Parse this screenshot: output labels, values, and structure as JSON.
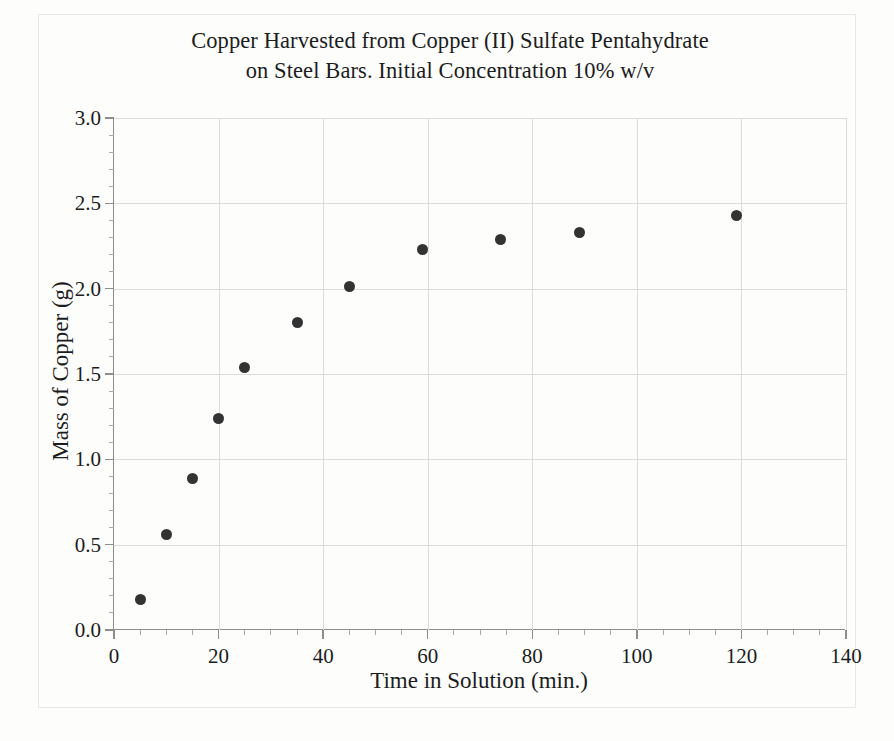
{
  "chart_data": {
    "type": "scatter",
    "title": "Copper Harvested from Copper (II) Sulfate Pentahydrate\non Steel Bars. Initial Concentration 10% w/v",
    "title_line1": "Copper Harvested from Copper (II) Sulfate Pentahydrate",
    "title_line2": "on Steel Bars. Initial Concentration 10% w/v",
    "xlabel": "Time in Solution (min.)",
    "ylabel": "Mass of Copper (g)",
    "xlim": [
      0,
      140
    ],
    "ylim": [
      0.0,
      3.0
    ],
    "x_major_step": 20,
    "x_minor_step": 5,
    "y_major_step": 0.5,
    "y_minor_step": 0.1,
    "grid": true,
    "legend": "none",
    "marker_color": "#333333",
    "grid_color": "#dcdcdc",
    "axis_color": "#8d8d8d",
    "x_tick_labels": [
      "0",
      "20",
      "40",
      "60",
      "80",
      "100",
      "120",
      "140"
    ],
    "x_tick_values": [
      0,
      20,
      40,
      60,
      80,
      100,
      120,
      140
    ],
    "y_tick_labels": [
      "0.0",
      "0.5",
      "1.0",
      "1.5",
      "2.0",
      "2.5",
      "3.0"
    ],
    "y_tick_values": [
      0.0,
      0.5,
      1.0,
      1.5,
      2.0,
      2.5,
      3.0
    ],
    "x": [
      5,
      10,
      15,
      20,
      25,
      35,
      45,
      59,
      74,
      89,
      119
    ],
    "y": [
      0.18,
      0.56,
      0.89,
      1.24,
      1.54,
      1.8,
      2.01,
      2.23,
      2.29,
      2.33,
      2.43
    ],
    "points": [
      {
        "x": 5,
        "y": 0.18
      },
      {
        "x": 10,
        "y": 0.56
      },
      {
        "x": 15,
        "y": 0.89
      },
      {
        "x": 20,
        "y": 1.24
      },
      {
        "x": 25,
        "y": 1.54
      },
      {
        "x": 35,
        "y": 1.8
      },
      {
        "x": 45,
        "y": 2.01
      },
      {
        "x": 59,
        "y": 2.23
      },
      {
        "x": 74,
        "y": 2.29
      },
      {
        "x": 89,
        "y": 2.33
      },
      {
        "x": 119,
        "y": 2.43
      }
    ]
  }
}
